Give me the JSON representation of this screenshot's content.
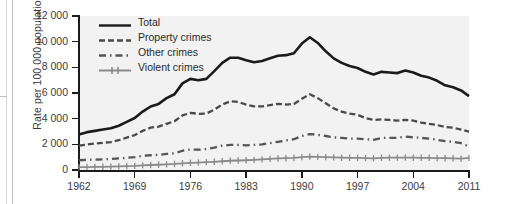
{
  "chart_data": {
    "type": "line",
    "title": "",
    "xlabel": "",
    "ylabel": "Rate per 100 000 population",
    "xlim": [
      1962,
      2011
    ],
    "ylim": [
      0,
      12000
    ],
    "yticks": [
      0,
      2000,
      4000,
      6000,
      8000,
      10000,
      12000
    ],
    "ytick_labels": [
      "0",
      "2 000",
      "4 000",
      "6 000",
      "8 000",
      "10 000",
      "12 000"
    ],
    "xticks": [
      1962,
      1969,
      1976,
      1983,
      1990,
      1997,
      2004,
      2011
    ],
    "xtick_labels": [
      "1962",
      "1969",
      "1976",
      "1983",
      "1990",
      "1997",
      "2004",
      "2011"
    ],
    "grid": false,
    "legend_position": "upper-left-inside",
    "x": [
      1962,
      1963,
      1964,
      1965,
      1966,
      1967,
      1968,
      1969,
      1970,
      1971,
      1972,
      1973,
      1974,
      1975,
      1976,
      1977,
      1978,
      1979,
      1980,
      1981,
      1982,
      1983,
      1984,
      1985,
      1986,
      1987,
      1988,
      1989,
      1990,
      1991,
      1992,
      1993,
      1994,
      1995,
      1996,
      1997,
      1998,
      1999,
      2000,
      2001,
      2002,
      2003,
      2004,
      2005,
      2006,
      2007,
      2008,
      2009,
      2010,
      2011
    ],
    "series": [
      {
        "name": "Total",
        "style": "solid",
        "color": "#1b1b1b",
        "values": [
          2771,
          2950,
          3050,
          3150,
          3250,
          3450,
          3750,
          4050,
          4550,
          4950,
          5150,
          5600,
          5900,
          6750,
          7100,
          7000,
          7100,
          7700,
          8350,
          8750,
          8750,
          8550,
          8400,
          8500,
          8700,
          8900,
          8950,
          9100,
          9850,
          10342,
          9900,
          9250,
          8700,
          8350,
          8100,
          7950,
          7650,
          7450,
          7650,
          7600,
          7550,
          7750,
          7600,
          7350,
          7200,
          6950,
          6600,
          6450,
          6200,
          5757
        ]
      },
      {
        "name": "Property crimes",
        "style": "dashed",
        "color": "#4a4a4a",
        "values": [
          1891,
          1980,
          2060,
          2120,
          2180,
          2320,
          2520,
          2720,
          3050,
          3300,
          3380,
          3600,
          3800,
          4250,
          4450,
          4380,
          4400,
          4700,
          5100,
          5350,
          5300,
          5100,
          4950,
          4950,
          5050,
          5150,
          5100,
          5150,
          5550,
          5902,
          5600,
          5200,
          4800,
          4550,
          4400,
          4300,
          4050,
          3900,
          3950,
          3900,
          3850,
          3900,
          3850,
          3700,
          3600,
          3500,
          3350,
          3300,
          3150,
          2990
        ]
      },
      {
        "name": "Other crimes",
        "style": "dash-dot",
        "color": "#555555",
        "values": [
          760,
          790,
          810,
          830,
          860,
          900,
          950,
          1000,
          1100,
          1150,
          1180,
          1250,
          1300,
          1500,
          1600,
          1580,
          1630,
          1750,
          1900,
          1950,
          1950,
          1920,
          1950,
          2000,
          2100,
          2200,
          2300,
          2400,
          2650,
          2800,
          2750,
          2650,
          2550,
          2500,
          2450,
          2450,
          2400,
          2350,
          2500,
          2500,
          2500,
          2600,
          2550,
          2500,
          2450,
          2350,
          2250,
          2200,
          2100,
          1823
        ]
      },
      {
        "name": "Violent crimes",
        "style": "solid-marked",
        "color": "#8a8a8a",
        "values": [
          221,
          230,
          240,
          250,
          260,
          280,
          300,
          320,
          360,
          390,
          410,
          440,
          470,
          520,
          560,
          580,
          610,
          640,
          680,
          720,
          740,
          760,
          790,
          830,
          870,
          900,
          920,
          940,
          1000,
          1050,
          1020,
          1000,
          980,
          960,
          950,
          940,
          930,
          910,
          950,
          960,
          960,
          970,
          960,
          950,
          950,
          930,
          920,
          910,
          880,
          944
        ]
      }
    ]
  },
  "legend": {
    "items": [
      {
        "label": "Total"
      },
      {
        "label": "Property crimes"
      },
      {
        "label": "Other crimes"
      },
      {
        "label": "Violent crimes"
      }
    ]
  }
}
